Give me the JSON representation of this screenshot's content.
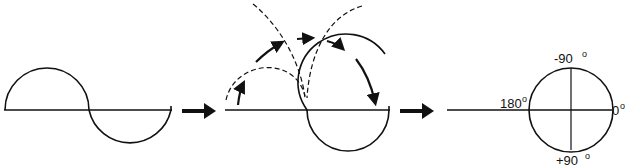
{
  "diagram": {
    "panels": [
      {
        "id": "sine-wave",
        "description": "One cycle of a sine wave on a horizontal axis"
      },
      {
        "id": "wrapping",
        "description": "Second half-cycle fixed; first half-cycle rotated over the top (dashed arcs with arrows) to wrap the wave into a circle"
      },
      {
        "id": "phase-circle",
        "description": "Resulting circle with phase angle labels"
      }
    ],
    "labels": {
      "top": "-90",
      "bottom": "+90",
      "left": "180",
      "right": "0",
      "degree": "o"
    },
    "colors": {
      "stroke": "#111111",
      "background": "#ffffff"
    }
  }
}
